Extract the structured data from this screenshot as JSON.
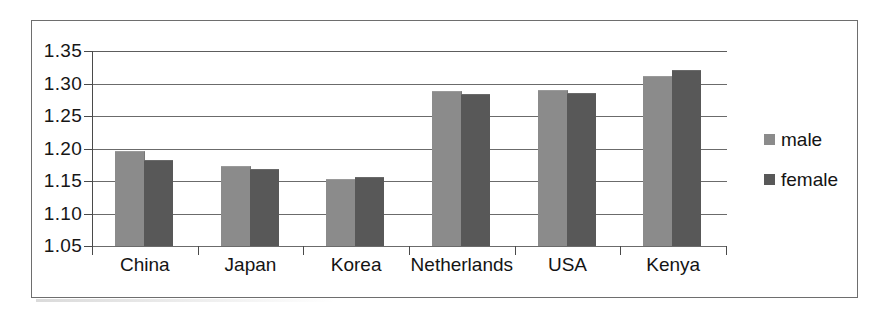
{
  "chart_data": {
    "type": "bar",
    "title": "",
    "xlabel": "",
    "ylabel": "",
    "categories": [
      "China",
      "Japan",
      "Korea",
      "Netherlands",
      "USA",
      "Kenya"
    ],
    "series": [
      {
        "name": "male",
        "color": "#8b8b8b",
        "values": [
          1.195,
          1.172,
          1.151,
          1.287,
          1.289,
          1.31
        ]
      },
      {
        "name": "female",
        "color": "#585858",
        "values": [
          1.181,
          1.167,
          1.154,
          1.282,
          1.284,
          1.32
        ]
      }
    ],
    "ylim": [
      1.05,
      1.35
    ],
    "ytick_step": 0.05,
    "ytick_labels": [
      "1.35",
      "1.30",
      "1.25",
      "1.20",
      "1.15",
      "1.10",
      "1.05"
    ],
    "ytick_values": [
      1.35,
      1.3,
      1.25,
      1.2,
      1.15,
      1.1,
      1.05
    ],
    "grid": true,
    "grid_axis": "y",
    "legend": [
      "male",
      "female"
    ],
    "legend_position": "right"
  },
  "legend": {
    "items": [
      {
        "label": "male"
      },
      {
        "label": "female"
      }
    ]
  },
  "colors": {
    "male_bar": "#8b8b8b",
    "female_bar": "#585858",
    "gridline": "#6b6b6b",
    "axis": "#4a4a4a",
    "frame": "#6e6e6e",
    "text": "#141414",
    "background": "#ffffff"
  }
}
